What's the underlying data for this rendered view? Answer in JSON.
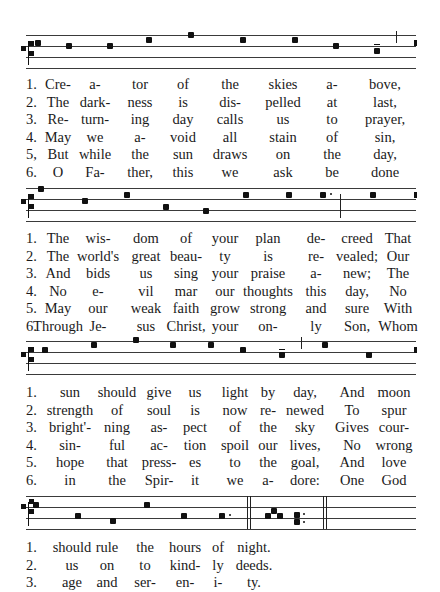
{
  "page": {
    "type": "chant hymn score",
    "staff_lines": 4
  },
  "systems": [
    {
      "columns": [
        58,
        95,
        140,
        183,
        230,
        283,
        332,
        385
      ],
      "verses": [
        {
          "num": "1.",
          "syllables": [
            "Cre-",
            "a-",
            "tor",
            "of",
            "the",
            "skies",
            "a-",
            "bove,"
          ]
        },
        {
          "num": "2.",
          "syllables": [
            "The",
            "dark-",
            "ness",
            "is",
            "dis-",
            "pelled",
            "at",
            "last,"
          ]
        },
        {
          "num": "3.",
          "syllables": [
            "Re-",
            "turn-",
            "ing",
            "day",
            "calls",
            "us",
            "to",
            "prayer,"
          ]
        },
        {
          "num": "4.",
          "syllables": [
            "May",
            "we",
            "a-",
            "void",
            "all",
            "stain",
            "of",
            "sin,"
          ]
        },
        {
          "num": "5,",
          "syllables": [
            "But",
            "while",
            "the",
            "sun",
            "draws",
            "on",
            "the",
            "day,"
          ]
        },
        {
          "num": "6.",
          "syllables": [
            "O",
            "Fa-",
            "ther,",
            "this",
            "we",
            "ask",
            "be",
            "done"
          ]
        }
      ]
    },
    {
      "columns": [
        58,
        98,
        146,
        186,
        225,
        268,
        316,
        357,
        398
      ],
      "verses": [
        {
          "num": "1.",
          "syllables": [
            "The",
            "wis-",
            "dom",
            "of",
            "your",
            "plan",
            "de-",
            "creed",
            "That"
          ]
        },
        {
          "num": "2.",
          "syllables": [
            "The",
            "world's",
            "great",
            "beau-",
            "ty",
            "is",
            "re-",
            "vealed;",
            "Our"
          ]
        },
        {
          "num": "3.",
          "syllables": [
            "And",
            "bids",
            "us",
            "sing",
            "your",
            "praise",
            "a-",
            "new;",
            "The"
          ]
        },
        {
          "num": "4.",
          "syllables": [
            "No",
            "e-",
            "vil",
            "mar",
            "our",
            "thoughts",
            "this",
            "day,",
            "No"
          ]
        },
        {
          "num": "5.",
          "syllables": [
            "May",
            "our",
            "weak",
            "faith",
            "grow",
            "strong",
            "and",
            "sure",
            "With"
          ]
        },
        {
          "num": "6.",
          "syllables": [
            "Through",
            "Je-",
            "sus",
            "Christ,",
            "your",
            "on-",
            "ly",
            "Son,",
            "Whom"
          ]
        }
      ]
    },
    {
      "columns": [
        70,
        117,
        159,
        195,
        235,
        268,
        305,
        352,
        394
      ],
      "verses": [
        {
          "num": "1.",
          "syllables": [
            "sun",
            "should",
            "give",
            "us",
            "light",
            "by",
            "day,",
            "And",
            "moon"
          ]
        },
        {
          "num": "2.",
          "syllables": [
            "strength",
            "of",
            "soul",
            "is",
            "now",
            "re-",
            "newed",
            "To",
            "spur"
          ]
        },
        {
          "num": "3.",
          "syllables": [
            "bright'-",
            "ning",
            "as-",
            "pect",
            "of",
            "the",
            "sky",
            "Gives",
            "cour-"
          ]
        },
        {
          "num": "4.",
          "syllables": [
            "sin-",
            "ful",
            "ac-",
            "tion",
            "spoil",
            "our",
            "lives,",
            "No",
            "wrong"
          ]
        },
        {
          "num": "5.",
          "syllables": [
            "hope",
            "that",
            "press-",
            "es",
            "to",
            "the",
            "goal,",
            "And",
            "love"
          ]
        },
        {
          "num": "6.",
          "syllables": [
            "in",
            "the",
            "Spir-",
            "it",
            "we",
            "a-",
            "dore:",
            "One",
            "God"
          ]
        }
      ]
    },
    {
      "columns": [
        72,
        107,
        145,
        185,
        218,
        254
      ],
      "verses": [
        {
          "num": "1.",
          "syllables": [
            "should",
            "rule",
            "the",
            "hours",
            "of",
            "night."
          ]
        },
        {
          "num": "2.",
          "syllables": [
            "us",
            "on",
            "to",
            "kind-",
            "ly",
            "deeds."
          ]
        },
        {
          "num": "3.",
          "syllables": [
            "age",
            "and",
            "ser-",
            "en-",
            "i-",
            "ty."
          ]
        }
      ]
    }
  ],
  "staves": [
    {
      "top": 35,
      "notes": [
        [
          35,
          8
        ],
        [
          66,
          11
        ],
        [
          107,
          11
        ],
        [
          146,
          5
        ],
        [
          188,
          0
        ],
        [
          240,
          5
        ],
        [
          292,
          5
        ],
        [
          333,
          11
        ],
        [
          374,
          16
        ]
      ],
      "dots": [],
      "episemas": [
        [
          374,
          9
        ]
      ],
      "bars": [
        {
          "x": 396,
          "top": -4,
          "h": 12
        }
      ],
      "custos": [
        [
          414,
          8
        ]
      ]
    },
    {
      "top": 188,
      "notes": [
        [
          38,
          1
        ],
        [
          82,
          13
        ],
        [
          124,
          7
        ],
        [
          163,
          19
        ],
        [
          203,
          23
        ],
        [
          243,
          7
        ],
        [
          286,
          7
        ],
        [
          320,
          7
        ],
        [
          370,
          7
        ]
      ],
      "dots": [
        [
          330,
          5
        ]
      ],
      "episemas": [],
      "bars": [
        {
          "x": 340,
          "top": 6,
          "h": 24
        }
      ],
      "custos": [
        [
          414,
          7
        ]
      ]
    },
    {
      "top": 341,
      "notes": [
        [
          42,
          9
        ],
        [
          91,
          4
        ],
        [
          133,
          -1
        ],
        [
          170,
          4
        ],
        [
          208,
          4
        ],
        [
          240,
          9
        ],
        [
          279,
          14
        ],
        [
          322,
          4
        ],
        [
          366,
          14
        ]
      ],
      "dots": [],
      "episemas": [
        [
          279,
          8
        ]
      ],
      "bars": [
        {
          "x": 301,
          "top": -4,
          "h": 12
        }
      ],
      "custos": [
        [
          414,
          9
        ]
      ]
    },
    {
      "top": 496,
      "notes": [
        [
          33,
          9
        ],
        [
          75,
          20
        ],
        [
          110,
          25
        ],
        [
          144,
          9
        ],
        [
          181,
          20
        ],
        [
          219,
          20
        ]
      ],
      "dots": [
        [
          229,
          18
        ]
      ],
      "episemas": [],
      "bars": [
        {
          "x": 247,
          "top": 0,
          "h": 33
        },
        {
          "x": 250,
          "top": 0,
          "h": 33
        },
        {
          "x": 323,
          "top": 0,
          "h": 33
        },
        {
          "x": 326,
          "top": 0,
          "h": 33
        }
      ],
      "neume": {
        "x": 265,
        "notes": [
          [
            0,
            20
          ],
          [
            6,
            15
          ],
          [
            12,
            20
          ]
        ]
      },
      "double": {
        "x": 294,
        "notes": [
          [
            0,
            19
          ],
          [
            0,
            26
          ]
        ],
        "dots": [
          [
            9,
            17
          ],
          [
            9,
            25
          ]
        ]
      },
      "custos": []
    }
  ]
}
